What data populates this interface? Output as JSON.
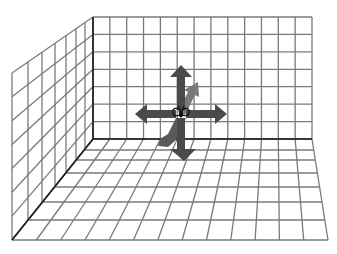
{
  "scene": {
    "title": "3D room grid with directional arrows",
    "colors": {
      "background": "#ffffff",
      "grid_line": "#7a7a7a",
      "corner_edge": "#1e1e1e",
      "arrow": "#4a4a4a"
    },
    "back_wall": {
      "x0": 93,
      "x1": 312,
      "y0": 17,
      "y1": 139,
      "columns": 13,
      "rows": 7
    },
    "left_wall": {
      "back_x": 93,
      "back_top": 17,
      "back_bottom": 139,
      "front_x": 12,
      "front_top": 73,
      "front_bottom": 240,
      "columns": 7,
      "column_xs": [
        12,
        28,
        42,
        55,
        66,
        76,
        85,
        93
      ],
      "rows": 7
    },
    "floor": {
      "back_y": 139,
      "back_x0": 93,
      "back_x1": 312,
      "front_y": 240,
      "front_x0": 12,
      "front_x1": 328,
      "columns": 13,
      "row_ys": [
        139,
        150,
        160,
        173,
        187,
        202,
        220,
        240
      ]
    },
    "arrows": [
      {
        "direction": "up",
        "label": "up-arrow"
      },
      {
        "direction": "left",
        "label": "left-arrow"
      },
      {
        "direction": "right",
        "label": "right-arrow"
      },
      {
        "direction": "down",
        "label": "down-arrow"
      },
      {
        "direction": "forward",
        "label": "toward-viewer-arrow"
      },
      {
        "direction": "backward",
        "label": "away-from-viewer-arrow"
      }
    ],
    "center_marker": "butterfly-figure"
  }
}
